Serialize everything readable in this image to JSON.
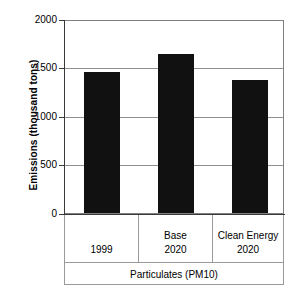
{
  "chart_data": {
    "type": "bar",
    "title": "",
    "subtitle": "",
    "xlabel": "Particulates (PM10)",
    "ylabel": "Emissions (thousand tons)",
    "categories": [
      "1999",
      "Base 2020",
      "Clean Energy 2020"
    ],
    "category_lines": [
      {
        "line1": "",
        "line2": "1999"
      },
      {
        "line1": "Base",
        "line2": "2020"
      },
      {
        "line1": "Clean Energy",
        "line2": "2020"
      }
    ],
    "values": [
      1450,
      1640,
      1370
    ],
    "ylim": [
      0,
      2000
    ],
    "yticks": [
      0,
      500,
      1000,
      1500,
      2000
    ],
    "ytick_labels": [
      "0",
      "500",
      "1000",
      "1500",
      "2000"
    ],
    "grid": true,
    "legend": false,
    "legend_position": "none",
    "series": [
      {
        "name": "Emissions",
        "values": [
          1450,
          1640,
          1370
        ],
        "color": "#111111"
      }
    ]
  },
  "colors": {
    "bar": "#111111",
    "grid": "#909090",
    "frame": "#808080",
    "axis": "#3a3a3a",
    "table_border": "#9a9a9a",
    "background": "#ffffff",
    "text": "#000000"
  }
}
